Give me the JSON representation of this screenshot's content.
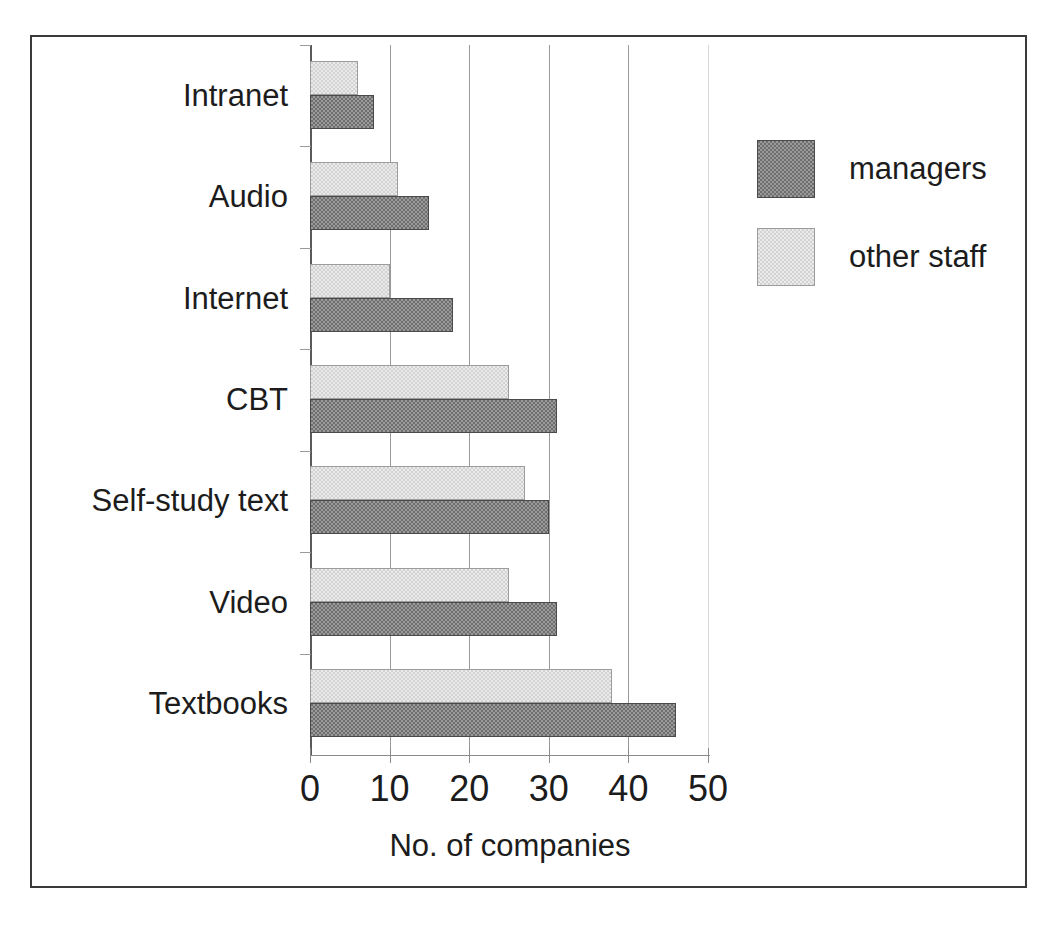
{
  "chart_data": {
    "type": "bar",
    "orientation": "horizontal",
    "title": "",
    "xlabel": "No. of companies",
    "ylabel": "",
    "xlim": [
      0,
      50
    ],
    "xticks": [
      0,
      10,
      20,
      30,
      40,
      50
    ],
    "xtick_labels": [
      "0",
      "10",
      "20",
      "30",
      "40",
      "50"
    ],
    "grid": "vertical",
    "legend_position": "right",
    "categories": [
      "Textbooks",
      "Video",
      "Self-study text",
      "CBT",
      "Internet",
      "Audio",
      "Intranet"
    ],
    "series": [
      {
        "name": "managers",
        "color": "#6e6e6e",
        "values": [
          46,
          31,
          30,
          31,
          18,
          15,
          8
        ]
      },
      {
        "name": "other staff",
        "color": "#d2d2d2",
        "values": [
          38,
          25,
          27,
          25,
          10,
          11,
          6
        ]
      }
    ]
  },
  "legend": {
    "items": [
      {
        "label": "managers",
        "swatch": "#6e6e6e"
      },
      {
        "label": "other staff",
        "swatch": "#d2d2d2"
      }
    ]
  },
  "axis": {
    "x_title": "No. of companies",
    "tick_labels": [
      "0",
      "10",
      "20",
      "30",
      "40",
      "50"
    ]
  },
  "category_labels": [
    "Intranet",
    "Audio",
    "Internet",
    "CBT",
    "Self-study text",
    "Video",
    "Textbooks"
  ],
  "colors": {
    "managers": "#6e6e6e",
    "other_staff": "#d2d2d2",
    "frame": "#3a3a3a",
    "gridline": "#9a9a9a",
    "text": "#1c1c1c",
    "background": "#ffffff"
  }
}
